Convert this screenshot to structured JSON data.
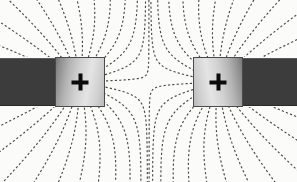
{
  "figure": {
    "title": "Electric field lines of two like point charges",
    "background_color": "#fbfbfa",
    "width": 297,
    "height": 182
  },
  "chart_data": {
    "type": "scatter",
    "title": "Electric field lines of two like point charges",
    "subtitle": "Field line map between two positive charges mounted on dark conducting bars",
    "xlabel": "",
    "ylabel": "",
    "xlim": [
      0,
      297
    ],
    "ylim": [
      0,
      182
    ],
    "grid": false,
    "legend_position": "none",
    "annotations": [
      "Both charges are positive (+)",
      "Field lines repel and never cross between the charges",
      "A neutral (null) point lies midway between the two charges"
    ],
    "field_line": {
      "style": "dashed",
      "color": "#4a4a4a",
      "dash_pattern": "2.2 2.2",
      "stroke_width": 1.15,
      "lines_per_charge": 26,
      "angle_start_deg": -168,
      "angle_step_deg": 13.8
    },
    "charges": [
      {
        "label": "+",
        "sign": "positive",
        "magnitude": 1,
        "center": {
          "x": 80,
          "y": 82
        },
        "plate": {
          "x": 55,
          "y": 57,
          "width": 50,
          "height": 50
        },
        "bar": {
          "x": 0,
          "y": 58,
          "width": 56,
          "height": 48
        }
      },
      {
        "label": "+",
        "sign": "positive",
        "magnitude": 1,
        "center": {
          "x": 218,
          "y": 82
        },
        "plate": {
          "x": 193,
          "y": 57,
          "width": 50,
          "height": 50
        },
        "bar": {
          "x": 242,
          "y": 58,
          "width": 55,
          "height": 48
        }
      }
    ],
    "null_point": {
      "x": 149,
      "y": 82
    },
    "colors": {
      "background": "#fbfbfa",
      "bar": "#3c3c3c",
      "plate_light": "#e4e4e4",
      "plate_dark": "#757575",
      "plate_border": "#4a4a4a",
      "field_line": "#4a4a4a",
      "plus_sign": "#0b0b0b"
    }
  },
  "charge_left": {
    "plus_label": "+",
    "name": "left-positive-charge"
  },
  "charge_right": {
    "plus_label": "+",
    "name": "right-positive-charge"
  },
  "caption": {
    "text": "Electric field lines of two like point charges"
  }
}
